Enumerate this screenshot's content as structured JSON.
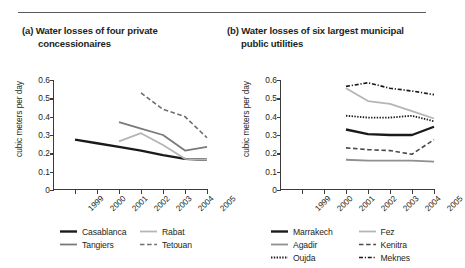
{
  "figure": {
    "ylabel": "cubic meters per day",
    "ytick_labels": [
      "0.6",
      "0.5",
      "0.4",
      "0.3",
      "0.2",
      "0.1",
      "0"
    ],
    "xtick_labels": [
      "1999",
      "2000",
      "2001",
      "2002",
      "2003",
      "2004",
      "2005"
    ]
  },
  "panels": [
    {
      "id": "panel-a",
      "title_line1": "(a) Water losses of four private",
      "title_line2": "concessionaires",
      "legend": [
        {
          "label": "Casablanca",
          "style": "solid-black-thick",
          "color": "#1a1a1a"
        },
        {
          "label": "Rabat",
          "style": "solid-lightgray",
          "color": "#b5b5b5"
        },
        {
          "label": "Tangiers",
          "style": "solid-gray",
          "color": "#7a7a7a"
        },
        {
          "label": "Tetouan",
          "style": "dashed-gray",
          "color": "#6e6e6e"
        }
      ]
    },
    {
      "id": "panel-b",
      "title_line1": "(b) Water losses of six largest municipal",
      "title_line2": "public utilities",
      "legend": [
        {
          "label": "Marrakech",
          "style": "solid-black-thick",
          "color": "#1a1a1a"
        },
        {
          "label": "Fez",
          "style": "solid-lightgray",
          "color": "#b5b5b5"
        },
        {
          "label": "Agadir",
          "style": "solid-gray",
          "color": "#8f8f8f"
        },
        {
          "label": "Kenitra",
          "style": "dashed-gray",
          "color": "#4a4a4a"
        },
        {
          "label": "Oujda",
          "style": "dotted-black",
          "color": "#1a1a1a"
        },
        {
          "label": "Meknes",
          "style": "dashdot-black",
          "color": "#1a1a1a"
        }
      ]
    }
  ],
  "chart_data": [
    {
      "type": "line",
      "title": "(a) Water losses of four private concessionaires",
      "xlabel": "",
      "ylabel": "cubic meters per day",
      "x": [
        1999,
        2000,
        2001,
        2002,
        2003,
        2004,
        2005
      ],
      "ylim": [
        0,
        0.6
      ],
      "yticks": [
        0,
        0.1,
        0.2,
        0.3,
        0.4,
        0.5,
        0.6
      ],
      "grid": false,
      "legend_position": "below",
      "series": [
        {
          "name": "Casablanca",
          "x": [
            1999,
            2000,
            2001,
            2002,
            2003,
            2004,
            2005
          ],
          "values": [
            0.275,
            0.255,
            0.235,
            0.215,
            0.19,
            0.17,
            0.165
          ]
        },
        {
          "name": "Tangiers",
          "x": [
            2001,
            2002,
            2003,
            2004,
            2005
          ],
          "values": [
            0.37,
            0.335,
            0.3,
            0.215,
            0.235
          ]
        },
        {
          "name": "Rabat",
          "x": [
            2001,
            2002,
            2003,
            2004,
            2005
          ],
          "values": [
            0.265,
            0.31,
            0.245,
            0.17,
            0.165
          ]
        },
        {
          "name": "Tetouan",
          "x": [
            2002,
            2003,
            2004,
            2005
          ],
          "values": [
            0.53,
            0.44,
            0.4,
            0.285
          ]
        }
      ]
    },
    {
      "type": "line",
      "title": "(b) Water losses of six largest municipal public utilities",
      "xlabel": "",
      "ylabel": "cubic meters per day",
      "x": [
        1999,
        2000,
        2001,
        2002,
        2003,
        2004,
        2005
      ],
      "ylim": [
        0,
        0.6
      ],
      "yticks": [
        0,
        0.1,
        0.2,
        0.3,
        0.4,
        0.5,
        0.6
      ],
      "grid": false,
      "legend_position": "below",
      "series": [
        {
          "name": "Marrakech",
          "x": [
            2001,
            2002,
            2003,
            2004,
            2005
          ],
          "values": [
            0.33,
            0.305,
            0.3,
            0.3,
            0.345
          ]
        },
        {
          "name": "Agadir",
          "x": [
            2001,
            2002,
            2003,
            2004,
            2005
          ],
          "values": [
            0.165,
            0.16,
            0.16,
            0.16,
            0.155
          ]
        },
        {
          "name": "Oujda",
          "x": [
            2001,
            2002,
            2003,
            2004,
            2005
          ],
          "values": [
            0.405,
            0.395,
            0.395,
            0.405,
            0.375
          ]
        },
        {
          "name": "Fez",
          "x": [
            2001,
            2002,
            2003,
            2004,
            2005
          ],
          "values": [
            0.555,
            0.485,
            0.47,
            0.43,
            0.39
          ]
        },
        {
          "name": "Kenitra",
          "x": [
            2001,
            2002,
            2003,
            2004,
            2005
          ],
          "values": [
            0.23,
            0.22,
            0.215,
            0.195,
            0.275
          ]
        },
        {
          "name": "Meknes",
          "x": [
            2001,
            2002,
            2003,
            2004,
            2005
          ],
          "values": [
            0.565,
            0.585,
            0.555,
            0.54,
            0.52
          ]
        }
      ]
    }
  ]
}
